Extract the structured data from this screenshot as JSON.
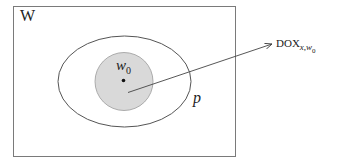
{
  "diagram": {
    "type": "set-diagram",
    "universe": {
      "label": "W",
      "stroke": "#7a7a7a"
    },
    "outer_region": {
      "label": "p",
      "stroke": "#555555"
    },
    "inner_region": {
      "fill": "#d9d9d9",
      "stroke": "#999999"
    },
    "point": {
      "label_base": "w",
      "label_sub": "0"
    },
    "arrow": {
      "target_label_base": "DOX",
      "target_label_sub_x": "x",
      "target_label_sub_sep": ",",
      "target_label_sub_w": "w",
      "target_label_sub_w0": "0",
      "color": "#444444"
    }
  }
}
